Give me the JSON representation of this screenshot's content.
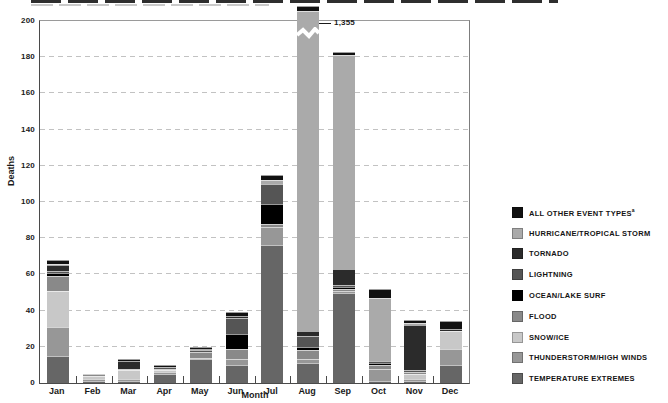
{
  "chart_data": {
    "type": "bar",
    "stacked": true,
    "title": "",
    "xlabel": "Month",
    "ylabel": "Deaths",
    "ylim": [
      0,
      200
    ],
    "ytick_interval": 20,
    "grid": "dashed horizontal gridlines every 20",
    "legend_position": "right",
    "categories": [
      "Jan",
      "Feb",
      "Mar",
      "Apr",
      "May",
      "Jun",
      "Jul",
      "Aug",
      "Sep",
      "Oct",
      "Nov",
      "Dec"
    ],
    "series_bottom_to_top": [
      {
        "name": "TEMPERATURE EXTREMES",
        "color": "#666666",
        "values": [
          15,
          1,
          1,
          5,
          13,
          10,
          76,
          11,
          50,
          1,
          1,
          10
        ]
      },
      {
        "name": "THUNDERSTORM/HIGH WINDS",
        "color": "#979797",
        "values": [
          16,
          1,
          1,
          1,
          1,
          3,
          10,
          2,
          1,
          7,
          1,
          9
        ]
      },
      {
        "name": "SNOW/ICE",
        "color": "#c8c8c8",
        "values": [
          20,
          2,
          5,
          1,
          0,
          0,
          0,
          0,
          0,
          0,
          3,
          10
        ]
      },
      {
        "name": "FLOOD",
        "color": "#898989",
        "values": [
          8,
          1,
          1,
          1,
          3,
          6,
          2,
          5,
          1,
          2,
          1,
          0
        ]
      },
      {
        "name": "OCEAN/LAKE SURF",
        "color": "#000000",
        "values": [
          2,
          0,
          0,
          0,
          0,
          8,
          11,
          2,
          1,
          1,
          0,
          0
        ]
      },
      {
        "name": "LIGHTNING",
        "color": "#555555",
        "values": [
          1,
          0,
          0,
          1,
          1,
          9,
          11,
          6,
          1,
          1,
          1,
          0
        ]
      },
      {
        "name": "TORNADO",
        "color": "#2b2b2b",
        "values": [
          3,
          0,
          4,
          0,
          1,
          1,
          0,
          3,
          9,
          0,
          25,
          1
        ]
      },
      {
        "name": "HURRICANE/TROPICAL STORM",
        "color": "#aaaaaa",
        "values": [
          1,
          0,
          0,
          0,
          0,
          0,
          2,
          1323,
          118,
          35,
          1,
          0
        ]
      },
      {
        "name": "ALL OTHER EVENT TYPES",
        "color": "#111111",
        "values": [
          2,
          0,
          1,
          1,
          1,
          2,
          3,
          3,
          2,
          5,
          2,
          4
        ],
        "superscript": "a"
      }
    ],
    "legend_order_top_to_bottom": [
      "ALL OTHER EVENT TYPES",
      "HURRICANE/TROPICAL STORM",
      "TORNADO",
      "LIGHTNING",
      "OCEAN/LAKE SURF",
      "FLOOD",
      "SNOW/ICE",
      "THUNDERSTORM/HIGH WINDS",
      "TEMPERATURE EXTREMES"
    ],
    "totals_by_month": [
      68,
      5,
      13,
      10,
      20,
      39,
      115,
      1355,
      183,
      52,
      35,
      34
    ],
    "broken_axis": {
      "category": "Aug",
      "bar_total": 1355,
      "label": "1,355"
    }
  }
}
